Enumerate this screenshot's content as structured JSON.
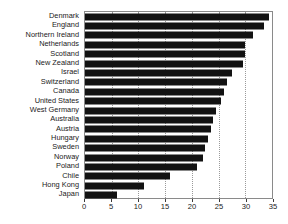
{
  "chart_data": {
    "type": "bar",
    "orientation": "horizontal",
    "title": "",
    "subtitle": "",
    "xlabel": "",
    "ylabel": "",
    "xlim": [
      0,
      35
    ],
    "ylim": null,
    "xticks": [
      0,
      5,
      10,
      15,
      20,
      25,
      30,
      35
    ],
    "xtick_labels": [
      "0",
      "5",
      "10",
      "15",
      "20",
      "25",
      "30",
      "35"
    ],
    "grid": true,
    "grid_axis": "x",
    "legend": null,
    "legend_position": "none",
    "bar_color": "#121212",
    "categories": [
      "Denmark",
      "England",
      "Northern Ireland",
      "Netherlands",
      "Scotland",
      "New Zealand",
      "Israel",
      "Switzerland",
      "Canada",
      "United States",
      "West Germany",
      "Australia",
      "Austria",
      "Hungary",
      "Sweden",
      "Norway",
      "Poland",
      "Chile",
      "Hong Kong",
      "Japan"
    ],
    "values": [
      34.5,
      33.5,
      31.5,
      30.0,
      30.0,
      29.5,
      27.5,
      26.5,
      26.0,
      25.5,
      24.5,
      24.0,
      23.5,
      23.0,
      22.5,
      22.0,
      21.0,
      16.0,
      11.0,
      6.0
    ]
  }
}
